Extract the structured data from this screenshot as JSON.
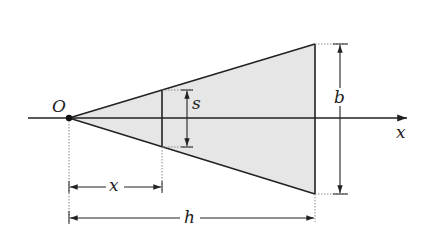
{
  "diagram": {
    "labels": {
      "origin": "O",
      "axis": "x",
      "slice_width": "s",
      "base_width": "b",
      "distance": "x",
      "height": "h"
    },
    "colors": {
      "fill": "#e6e6e6",
      "stroke": "#222222",
      "guide": "#888888"
    }
  }
}
